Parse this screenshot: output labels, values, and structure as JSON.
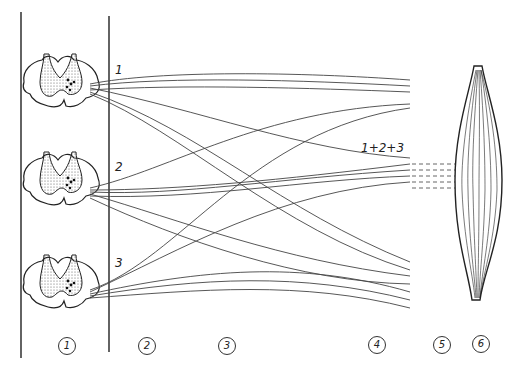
{
  "figure": {
    "segment_labels": [
      "1",
      "2",
      "3"
    ],
    "convergence_label": "1+2+3",
    "region_markers": [
      "1",
      "2",
      "3",
      "4",
      "5",
      "6"
    ],
    "region_meanings": {
      "1": "spinal cord segments",
      "2": "ventral roots",
      "3": "plexus",
      "4": "peripheral nerve",
      "5": "nerve entry / end branches",
      "6": "muscle"
    },
    "colors": {
      "line": "#333333",
      "stipple": "#555555",
      "background": "#ffffff"
    }
  }
}
